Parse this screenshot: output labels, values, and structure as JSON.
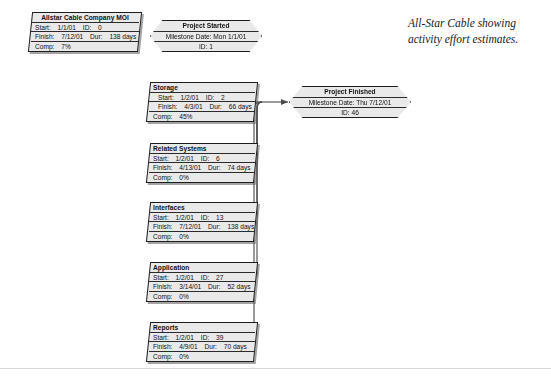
{
  "caption": {
    "line1": "All-Star Cable showing",
    "line2": "activity effort estimates."
  },
  "labels": {
    "start": "Start:",
    "finish": "Finish:",
    "id": "ID:",
    "dur": "Dur:",
    "comp": "Comp:",
    "milestone_date": "Milestone Date:"
  },
  "summary_node": {
    "title": "Allstar Cable Company MOI",
    "start": "1/1/01",
    "id": "0",
    "finish": "7/12/01",
    "dur": "138 days",
    "comp": "7%"
  },
  "milestones": [
    {
      "name": "project-started",
      "title": "Project Started",
      "date": "Mon 1/1/01",
      "id": "1"
    },
    {
      "name": "project-finished",
      "title": "Project Finished",
      "date": "Thu 7/12/01",
      "id": "46"
    }
  ],
  "tasks": [
    {
      "name": "storage",
      "title": "Storage",
      "start": "1/2/01",
      "id": "2",
      "finish": "4/3/01",
      "dur": "66 days",
      "comp": "45%"
    },
    {
      "name": "related-systems",
      "title": "Related Systems",
      "start": "1/2/01",
      "id": "6",
      "finish": "4/13/01",
      "dur": "74 days",
      "comp": "0%"
    },
    {
      "name": "interfaces",
      "title": "Interfaces",
      "start": "1/2/01",
      "id": "13",
      "finish": "7/12/01",
      "dur": "138 days",
      "comp": "0%"
    },
    {
      "name": "application",
      "title": "Application",
      "start": "1/2/01",
      "id": "27",
      "finish": "3/14/01",
      "dur": "52 days",
      "comp": "0%"
    },
    {
      "name": "reports",
      "title": "Reports",
      "start": "1/2/01",
      "id": "39",
      "finish": "4/9/01",
      "dur": "70 days",
      "comp": "0%"
    }
  ],
  "colors": {
    "node_fill": "#e9e9e9",
    "node_border": "#1d1d1d",
    "connector": "#4a4a4a",
    "page_bg": "#ffffff"
  }
}
